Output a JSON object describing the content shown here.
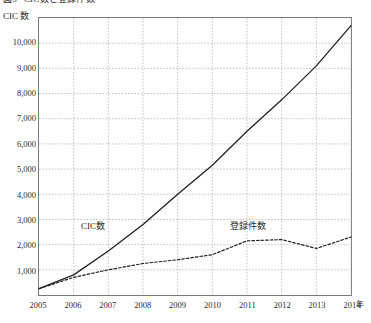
{
  "figure": {
    "title_number": "図5",
    "title_text": "CIC数と登録件数",
    "y_axis_caption": "CIC 数",
    "x_axis_unit": "年"
  },
  "axis": {
    "y_ticks": [
      "10,000",
      "9,000",
      "8,000",
      "7,000",
      "6,000",
      "5,000",
      "4,000",
      "3,000",
      "2,000",
      "1,000"
    ],
    "x_ticks": [
      "2005",
      "2006",
      "2007",
      "2008",
      "2009",
      "2010",
      "2011",
      "2012",
      "2013",
      "2014"
    ]
  },
  "series_labels": {
    "cic": "CIC数",
    "registrations": "登録件数"
  },
  "colors": {
    "line": "#231f20",
    "grid": "#b5b5b5",
    "frame": "#7a7a7a",
    "text": "#2b2b2b"
  },
  "chart_data": {
    "type": "line",
    "xlabel": "年",
    "ylabel": "CIC 数",
    "xlim": [
      2005,
      2014
    ],
    "ylim": [
      0,
      11000
    ],
    "grid": true,
    "legend": "inline-labels",
    "x": [
      2005,
      2006,
      2007,
      2008,
      2009,
      2010,
      2011,
      2012,
      2013,
      2014
    ],
    "y_ticks": [
      1000,
      2000,
      3000,
      4000,
      5000,
      6000,
      7000,
      8000,
      9000,
      10000
    ],
    "series": [
      {
        "name": "CIC数",
        "style": "solid",
        "values": [
          250,
          800,
          1750,
          2800,
          4000,
          5150,
          6500,
          7750,
          9100,
          10700
        ]
      },
      {
        "name": "登録件数",
        "style": "dashed",
        "values": [
          250,
          700,
          1000,
          1250,
          1400,
          1600,
          2150,
          2200,
          1850,
          2300
        ]
      }
    ]
  }
}
